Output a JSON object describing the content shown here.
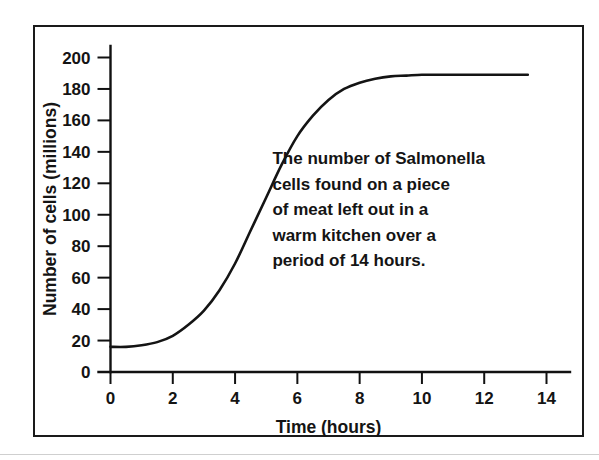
{
  "figure": {
    "border_color": "#1a1a1a",
    "background": "#ffffff"
  },
  "chart_data": {
    "type": "line",
    "title": "",
    "xlabel": "Time (hours)",
    "ylabel": "Number of cells (millions)",
    "xlim": [
      0,
      14
    ],
    "ylim": [
      0,
      200
    ],
    "grid": false,
    "legend": null,
    "line_color": "#141414",
    "xticks": [
      0,
      2,
      4,
      6,
      8,
      10,
      12,
      14
    ],
    "xtick_labels": [
      "0",
      "2",
      "4",
      "6",
      "8",
      "10",
      "12",
      "14"
    ],
    "yticks": [
      0,
      20,
      40,
      60,
      80,
      100,
      120,
      140,
      160,
      180,
      200
    ],
    "ytick_labels": [
      "0",
      "20",
      "40",
      "60",
      "80",
      "100",
      "120",
      "140",
      "160",
      "180",
      "200"
    ],
    "series": [
      {
        "name": "Salmonella cells",
        "x": [
          0.0,
          0.5,
          1.0,
          1.5,
          2.0,
          2.5,
          3.0,
          3.5,
          4.0,
          4.5,
          5.0,
          5.5,
          6.0,
          6.5,
          7.0,
          7.5,
          8.0,
          8.5,
          9.0,
          9.5,
          10.0,
          10.5,
          11.0,
          11.5,
          12.0,
          12.5,
          13.0,
          13.4
        ],
        "values": [
          16,
          16,
          17,
          19,
          23,
          30,
          39,
          52,
          69,
          90,
          111,
          132,
          150,
          163,
          173,
          180,
          184,
          186.5,
          188,
          188.5,
          189,
          189,
          189,
          189,
          189,
          189,
          189,
          189
        ]
      }
    ],
    "annotation": {
      "lines": [
        "The number of Salmonella",
        "cells found on a piece",
        "of meat left out in a",
        "warm kitchen over a",
        "period of 14 hours."
      ],
      "x": 5.2,
      "y": 132
    }
  }
}
